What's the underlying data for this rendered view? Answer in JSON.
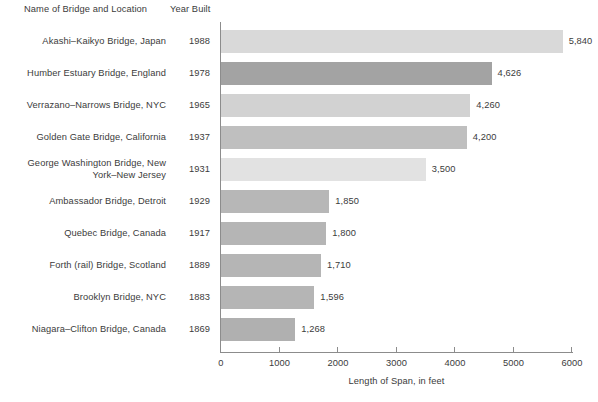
{
  "header": {
    "name_column": "Name of Bridge and Location",
    "year_column": "Year Built"
  },
  "chart_data": {
    "type": "bar",
    "orientation": "horizontal",
    "title": "",
    "xlabel": "Length of Span, in feet",
    "ylabel": "",
    "xlim": [
      0,
      6000
    ],
    "xticks": [
      0,
      1000,
      2000,
      3000,
      4000,
      5000,
      6000
    ],
    "xtick_labels": [
      "0",
      "1000",
      "2000",
      "3000",
      "4000",
      "5000",
      "6000"
    ],
    "grid": false,
    "legend": "none",
    "categories": [
      "Akashi–Kaikyo Bridge, Japan",
      "Humber Estuary Bridge, England",
      "Verrazano–Narrows Bridge, NYC",
      "Golden Gate Bridge, California",
      "George Washington Bridge, New York–New Jersey",
      "Ambassador Bridge, Detroit",
      "Quebec Bridge, Canada",
      "Forth (rail) Bridge, Scotland",
      "Brooklyn Bridge, NYC",
      "Niagara–Clifton Bridge, Canada"
    ],
    "values": [
      5840,
      4626,
      4260,
      4200,
      3500,
      1850,
      1800,
      1710,
      1596,
      1268
    ],
    "value_labels": [
      "5,840",
      "4,626",
      "4,260",
      "4,200",
      "3,500",
      "1,850",
      "1,800",
      "1,710",
      "1,596",
      "1,268"
    ],
    "years": [
      "1988",
      "1978",
      "1965",
      "1937",
      "1931",
      "1929",
      "1917",
      "1889",
      "1883",
      "1869"
    ],
    "bar_colors": [
      "#d9d9d9",
      "#a3a3a3",
      "#d2d2d2",
      "#bfbfbf",
      "#e2e2e2",
      "#b7b7b7",
      "#b5b5b5",
      "#b5b5b5",
      "#b5b5b5",
      "#b0b0b0"
    ],
    "axis_color": "#8c8c8c",
    "text_color": "#3b3b3b"
  },
  "rows": [
    {
      "label_line1": "Akashi–Kaikyo Bridge, Japan",
      "label_line2": "",
      "year": "1988",
      "value_label": "5,840"
    },
    {
      "label_line1": "Humber Estuary Bridge, England",
      "label_line2": "",
      "year": "1978",
      "value_label": "4,626"
    },
    {
      "label_line1": "Verrazano–Narrows Bridge, NYC",
      "label_line2": "",
      "year": "1965",
      "value_label": "4,260"
    },
    {
      "label_line1": "Golden Gate Bridge, California",
      "label_line2": "",
      "year": "1937",
      "value_label": "4,200"
    },
    {
      "label_line1": "George Washington Bridge, New",
      "label_line2": "York–New Jersey",
      "year": "1931",
      "value_label": "3,500"
    },
    {
      "label_line1": "Ambassador Bridge, Detroit",
      "label_line2": "",
      "year": "1929",
      "value_label": "1,850"
    },
    {
      "label_line1": "Quebec Bridge, Canada",
      "label_line2": "",
      "year": "1917",
      "value_label": "1,800"
    },
    {
      "label_line1": "Forth (rail) Bridge, Scotland",
      "label_line2": "",
      "year": "1889",
      "value_label": "1,710"
    },
    {
      "label_line1": "Brooklyn Bridge, NYC",
      "label_line2": "",
      "year": "1883",
      "value_label": "1,596"
    },
    {
      "label_line1": "Niagara–Clifton Bridge, Canada",
      "label_line2": "",
      "year": "1869",
      "value_label": "1,268"
    }
  ]
}
